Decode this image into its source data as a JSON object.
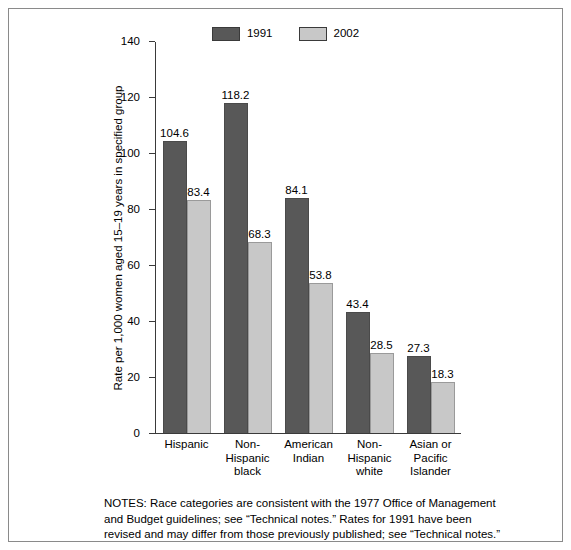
{
  "chart_data": {
    "type": "bar",
    "title": "",
    "xlabel": "",
    "ylabel": "Rate per 1,000 women aged 15–19 years in specified group",
    "ylim": [
      0,
      140
    ],
    "yticks": [
      0,
      20,
      40,
      60,
      80,
      100,
      120,
      140
    ],
    "grid": false,
    "legend_position": "top-center",
    "categories": [
      "Hispanic",
      "Non-\nHispanic\nblack",
      "American\nIndian",
      "Non-\nHispanic\nwhite",
      "Asian or\nPacific\nIslander"
    ],
    "category_lines": [
      [
        "Hispanic"
      ],
      [
        "Non-",
        "Hispanic",
        "black"
      ],
      [
        "American",
        "Indian"
      ],
      [
        "Non-",
        "Hispanic",
        "white"
      ],
      [
        "Asian or",
        "Pacific",
        "Islander"
      ]
    ],
    "series": [
      {
        "name": "1991",
        "color": "#585858",
        "values": [
          104.6,
          118.2,
          84.1,
          43.4,
          27.3
        ],
        "labels": [
          "104.6",
          "118.2",
          "84.1",
          "43.4",
          "27.3"
        ]
      },
      {
        "name": "2002",
        "color": "#c8c8c8",
        "values": [
          83.4,
          68.3,
          53.8,
          28.5,
          18.3
        ],
        "labels": [
          "83.4",
          "68.3",
          "53.8",
          "28.5",
          "18.3"
        ]
      }
    ]
  },
  "legend": {
    "entries": [
      {
        "label": "1991",
        "color": "#585858"
      },
      {
        "label": "2002",
        "color": "#c8c8c8"
      }
    ]
  },
  "notes": {
    "text": "NOTES: Race categories are consistent with the 1977 Office of Management and Budget guidelines; see “Technical notes.” Rates for 1991 have been revised and may differ from those previously published; see “Technical notes.”"
  },
  "colors": {
    "axis": "#3a3a3a",
    "frame": "#8a8a8a",
    "bar_1991": "#585858",
    "bar_2002": "#c8c8c8",
    "background": "#ffffff"
  }
}
